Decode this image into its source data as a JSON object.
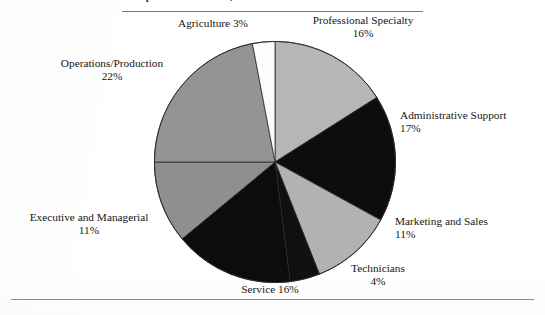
{
  "figure": {
    "title": "Occupational Structure, Mexico",
    "title_note": "cropped at top edge of scan"
  },
  "chart_data": {
    "type": "pie",
    "title": "Occupational Structure, Mexico",
    "xlabel": "",
    "ylabel": "",
    "legend_position": "none",
    "labels_outside": true,
    "units": "percent",
    "total": 100,
    "start_angle_deg": 0,
    "direction": "clockwise",
    "categories": [
      "Professional Specialty",
      "Administrative Support",
      "Marketing and Sales",
      "Technicians",
      "Service",
      "Executive and Managerial",
      "Operations/Production",
      "Agriculture"
    ],
    "values": [
      16,
      17,
      11,
      4,
      16,
      11,
      22,
      3
    ],
    "colors": [
      "#b6b6b6",
      "#0d0d0d",
      "#b2b2b2",
      "#101010",
      "#0c0c0c",
      "#8f8f8f",
      "#949494",
      "#fcfcfc"
    ],
    "slices": [
      {
        "name": "Professional Specialty",
        "value": 16,
        "label": "Professional Specialty",
        "pct_label": "16%",
        "color": "#b6b6b6",
        "start_deg": 0,
        "end_deg": 57.6
      },
      {
        "name": "Administrative Support",
        "value": 17,
        "label": "Administrative Support",
        "pct_label": "17%",
        "color": "#0d0d0d",
        "start_deg": 57.6,
        "end_deg": 118.8
      },
      {
        "name": "Marketing and Sales",
        "value": 11,
        "label": "Marketing and Sales",
        "pct_label": "11%",
        "color": "#b2b2b2",
        "start_deg": 118.8,
        "end_deg": 158.4
      },
      {
        "name": "Technicians",
        "value": 4,
        "label": "Technicians",
        "pct_label": "4%",
        "color": "#101010",
        "start_deg": 158.4,
        "end_deg": 172.8
      },
      {
        "name": "Service",
        "value": 16,
        "label": "Service",
        "pct_label": "16%",
        "color": "#0c0c0c",
        "start_deg": 172.8,
        "end_deg": 230.4
      },
      {
        "name": "Executive and Managerial",
        "value": 11,
        "label": "Executive and Managerial",
        "pct_label": "11%",
        "color": "#8f8f8f",
        "start_deg": 230.4,
        "end_deg": 270.0
      },
      {
        "name": "Operations/Production",
        "value": 22,
        "label": "Operations/Production",
        "pct_label": "22%",
        "color": "#949494",
        "start_deg": 270.0,
        "end_deg": 349.2
      },
      {
        "name": "Agriculture",
        "value": 3,
        "label": "Agriculture",
        "pct_label": "3%",
        "color": "#fcfcfc",
        "start_deg": 349.2,
        "end_deg": 360.0
      }
    ]
  },
  "labels": {
    "agriculture": {
      "name": "Agriculture",
      "pct": "3%",
      "combined": "Agriculture 3%"
    },
    "professional": {
      "name": "Professional Specialty",
      "pct": "16%"
    },
    "operations": {
      "name": "Operations/Production",
      "pct": "22%"
    },
    "administrative": {
      "name": "Administrative Support",
      "pct": "17%"
    },
    "marketing": {
      "name": "Marketing and Sales",
      "pct": "11%"
    },
    "technicians": {
      "name": "Technicians",
      "pct": "4%"
    },
    "service": {
      "name": "Service",
      "pct": "16%",
      "combined": "Service 16%"
    },
    "executive": {
      "name": "Executive and Managerial",
      "pct": "11%"
    }
  }
}
